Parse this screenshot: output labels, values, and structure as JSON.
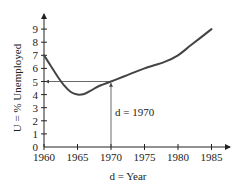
{
  "chart_data": {
    "type": "line",
    "title": "",
    "xlabel": "d = Year",
    "ylabel": "U = % Unemployed",
    "xlim": [
      1960,
      1987
    ],
    "ylim": [
      0,
      9.8
    ],
    "xticks": [
      1960,
      1965,
      1970,
      1975,
      1980,
      1985
    ],
    "xtick_labels": [
      "1960",
      "1965",
      "1970",
      "1975",
      "1980",
      "1985"
    ],
    "yticks": [
      0,
      1,
      2,
      3,
      4,
      5,
      6,
      7,
      8,
      9
    ],
    "ytick_labels": [
      "0",
      "1",
      "2",
      "3",
      "4",
      "5",
      "6",
      "7",
      "8",
      "9"
    ],
    "grid": false,
    "series": [
      {
        "name": "Unemployment",
        "x": [
          1960,
          1961,
          1962,
          1963,
          1964,
          1965,
          1966,
          1967,
          1968,
          1970,
          1972,
          1975,
          1978,
          1980,
          1982,
          1985
        ],
        "y": [
          7.0,
          6.2,
          5.4,
          4.7,
          4.2,
          4.0,
          4.05,
          4.3,
          4.6,
          5.0,
          5.4,
          6.0,
          6.5,
          7.0,
          7.8,
          9.0
        ]
      }
    ],
    "annotations": [
      {
        "text": "d = 1970",
        "x": 1970,
        "y": 5,
        "note": "arrow from x-axis up to curve at 1970, then arrow left to U = 5"
      }
    ]
  }
}
